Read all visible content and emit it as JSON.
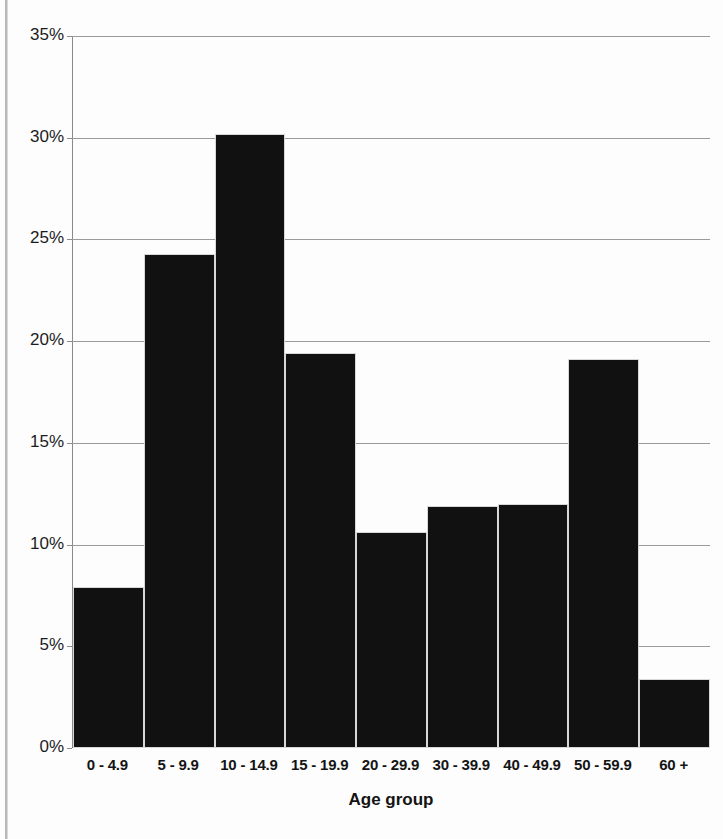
{
  "chart_data": {
    "type": "bar",
    "title": "",
    "subtitle": "",
    "xlabel": "Age group",
    "ylabel": "",
    "categories": [
      "0 - 4.9",
      "5 - 9.9",
      "10 - 14.9",
      "15 - 19.9",
      "20 - 29.9",
      "30 - 39.9",
      "40 - 49.9",
      "50 - 59.9",
      "60 +"
    ],
    "values": [
      7.9,
      24.3,
      30.2,
      19.4,
      10.6,
      11.9,
      12.0,
      19.1,
      3.4
    ],
    "ylim": [
      0,
      35
    ],
    "ytick_labels": [
      "35%",
      "30%",
      "25%",
      "20%",
      "15%",
      "10%",
      "5%",
      "0%"
    ],
    "ytick_values": [
      35,
      30,
      25,
      20,
      15,
      10,
      5,
      0
    ],
    "ytick_interval": 5,
    "grid": true,
    "grid_axis": "y",
    "legend": false,
    "legend_position": "none",
    "bar_color": "#111111",
    "bar_edge_color": "#d8d8d8",
    "gridline_color": "#9a9a9a",
    "axis_color": "#8a8a8a",
    "background_color": "#ffffff",
    "value_format": "percent",
    "bar_gap": "histogram-contiguous"
  }
}
